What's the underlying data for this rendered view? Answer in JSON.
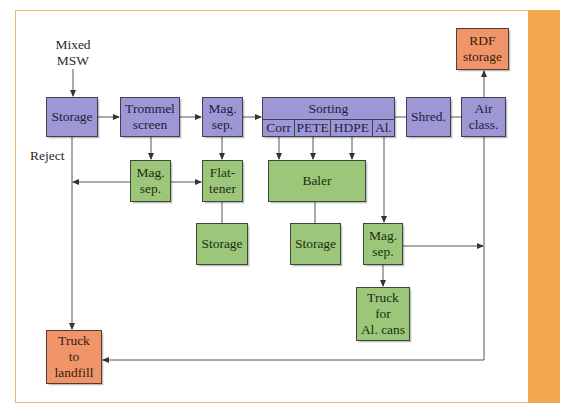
{
  "diagram": {
    "input_label": [
      "Mixed",
      "MSW"
    ],
    "reject_label": "Reject",
    "nodes": {
      "storage_in": {
        "label": "Storage",
        "color": "#9d97d6"
      },
      "trommel": {
        "lines": [
          "Trommel",
          "screen"
        ],
        "color": "#9d97d6"
      },
      "mag_sep_1": {
        "lines": [
          "Mag.",
          "sep."
        ],
        "color": "#9d97d6"
      },
      "sorting": {
        "label": "Sorting",
        "cells": [
          "Corr",
          "PETE",
          "HDPE",
          "Al."
        ],
        "color": "#9d97d6"
      },
      "shred": {
        "label": "Shred.",
        "color": "#9d97d6"
      },
      "air_class": {
        "lines": [
          "Air",
          "class."
        ],
        "color": "#9d97d6"
      },
      "rdf_storage": {
        "lines": [
          "RDF",
          "storage"
        ],
        "color": "#f0946a"
      },
      "mag_sep_2": {
        "lines": [
          "Mag.",
          "sep."
        ],
        "color": "#9cc77a"
      },
      "flattener": {
        "lines": [
          "Flat-",
          "tener"
        ],
        "color": "#9cc77a"
      },
      "baler": {
        "label": "Baler",
        "color": "#9cc77a"
      },
      "storage_flat": {
        "label": "Storage",
        "color": "#9cc77a"
      },
      "storage_baler": {
        "label": "Storage",
        "color": "#9cc77a"
      },
      "mag_sep_3": {
        "lines": [
          "Mag.",
          "sep."
        ],
        "color": "#9cc77a"
      },
      "truck_al": {
        "lines": [
          "Truck",
          "for",
          "Al. cans"
        ],
        "color": "#9cc77a"
      },
      "truck_landfill": {
        "lines": [
          "Truck",
          "to",
          "landfill"
        ],
        "color": "#f0946a"
      }
    },
    "colors": {
      "frame": "#f2b56b",
      "stripe": "#f4a64d",
      "wire": "#444444"
    }
  }
}
